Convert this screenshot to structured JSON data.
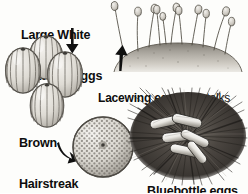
{
  "figure": {
    "type": "illustrated-diagram",
    "background_color": "#fdfdfb",
    "text_color": "#0d0d0d"
  },
  "labels": {
    "large_white": {
      "line1": "Large White",
      "line2": "Butterfly eggs",
      "style": "bold"
    },
    "brown_hairstreak": {
      "line1": "Brown",
      "line2": "Hairstreak",
      "line3": "Butterfly",
      "line4": "egg",
      "style": "bold"
    },
    "lacewing": {
      "bold_part": "Lacewing eggs",
      "regular_part_line1": " on stalks",
      "regular_part_line2": "made of gum by female"
    },
    "bluebottle": {
      "text": "Bluebottle eggs",
      "style": "bold"
    }
  },
  "arrows": [
    {
      "name": "arrow-to-large-white-eggs",
      "direction": "down"
    },
    {
      "name": "arrow-to-lacewing-eggs",
      "direction": "up"
    },
    {
      "name": "arrow-to-brown-hairstreak-egg",
      "direction": "down-right-curved"
    }
  ],
  "illustrations": {
    "large_white_eggs": {
      "name": "large-white-butterfly-eggs-illustration",
      "description": "Cluster of four upright ribbed oval eggs with vertical ridges",
      "egg_count": 4,
      "fill": "#d8d5cf",
      "line": "#55524c"
    },
    "lacewing_eggs": {
      "name": "lacewing-eggs-illustration",
      "description": "Slender stalks topped with oval egg capsules rising from a domed leaf surface",
      "stalk_count": 11,
      "fill": "#cfccc6",
      "line": "#6b6860"
    },
    "brown_hairstreak_egg": {
      "name": "brown-hairstreak-butterfly-egg-illustration",
      "description": "Single spherical egg with deeply pitted honeycomb surface texture",
      "egg_count": 1,
      "fill": "#d2cfc8",
      "line": "#58554f"
    },
    "bluebottle_eggs": {
      "name": "bluebottle-eggs-illustration",
      "description": "Cluster of elongated pale capsule-shaped eggs laid among dark coarse hairs",
      "egg_count": 6,
      "fill": "#efeeea",
      "line": "#2c2a27",
      "background": "#3a3734"
    }
  }
}
